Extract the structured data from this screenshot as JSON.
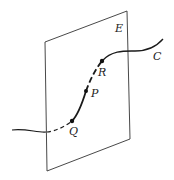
{
  "diagram": {
    "plane": {
      "label": "E"
    },
    "curve": {
      "label": "C"
    },
    "points": [
      {
        "label": "Q"
      },
      {
        "label": "P"
      },
      {
        "label": "R"
      }
    ],
    "colors": {
      "stroke": "#1a1a1a",
      "background": "#ffffff"
    }
  }
}
